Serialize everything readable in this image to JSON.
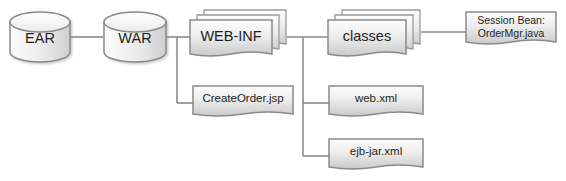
{
  "diagram": {
    "background_color": "#ffffff",
    "line_color": "#808080",
    "text_color": "#231f20",
    "shape_fill_light": "#f2f2f2",
    "shape_fill_dark": "#d4d4d4",
    "shape_border": "#8c8c8c",
    "nodes": [
      {
        "id": "ear",
        "label": "EAR",
        "shape": "cylinder",
        "x": 10,
        "y": 13,
        "width": 60,
        "height": 48
      },
      {
        "id": "war",
        "label": "WAR",
        "shape": "cylinder",
        "x": 104,
        "y": 13,
        "width": 62,
        "height": 48
      },
      {
        "id": "web-inf",
        "label": "WEB-INF",
        "shape": "stacked-document",
        "x": 190,
        "y": 10,
        "width": 96,
        "height": 50
      },
      {
        "id": "classes",
        "label": "classes",
        "shape": "stacked-document",
        "x": 328,
        "y": 10,
        "width": 92,
        "height": 50
      },
      {
        "id": "session-bean",
        "label": "Session Bean:\nOrderMgr.java",
        "label_line1": "Session Bean:",
        "label_line2": "OrderMgr.java",
        "shape": "document",
        "x": 466,
        "y": 12,
        "width": 90,
        "height": 36
      },
      {
        "id": "create-order-jsp",
        "label": "CreateOrder.jsp",
        "shape": "document",
        "x": 193,
        "y": 86,
        "width": 100,
        "height": 33
      },
      {
        "id": "web-xml",
        "label": "web.xml",
        "shape": "document",
        "x": 329,
        "y": 86,
        "width": 94,
        "height": 33
      },
      {
        "id": "ejb-jar-xml",
        "label": "ejb-jar.xml",
        "shape": "document",
        "x": 329,
        "y": 139,
        "width": 94,
        "height": 33
      }
    ],
    "edges": [
      {
        "id": "ear-war",
        "from": "ear",
        "to": "war",
        "style": "straight"
      },
      {
        "id": "war-webinf",
        "from": "war",
        "to": "web-inf",
        "style": "straight"
      },
      {
        "id": "war-createorder",
        "from": "war",
        "to": "create-order-jsp",
        "style": "elbow"
      },
      {
        "id": "webinf-classes",
        "from": "web-inf",
        "to": "classes",
        "style": "straight"
      },
      {
        "id": "webinf-webxml",
        "from": "web-inf",
        "to": "web-xml",
        "style": "elbow"
      },
      {
        "id": "webinf-ejbjarxml",
        "from": "web-inf",
        "to": "ejb-jar-xml",
        "style": "elbow"
      },
      {
        "id": "classes-sessionbean",
        "from": "classes",
        "to": "session-bean",
        "style": "straight"
      }
    ]
  }
}
